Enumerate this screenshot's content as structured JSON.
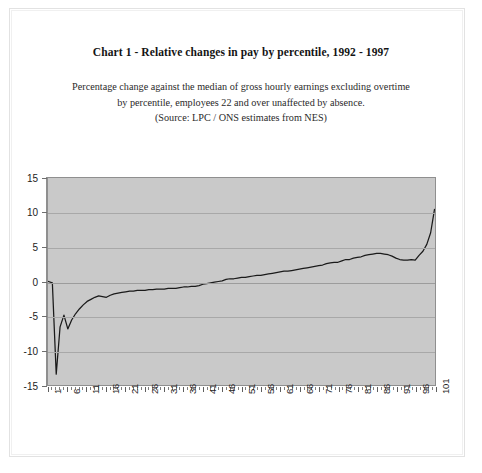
{
  "title": "Chart 1 -  Relative changes in pay by percentile, 1992 - 1997",
  "subtitle": {
    "line1": "Percentage change against the median of  gross hourly earnings excluding overtime",
    "line2": "by percentile, employees 22 and over  unaffected by absence.",
    "line3": "(Source: LPC / ONS estimates from NES)"
  },
  "chart_data": {
    "type": "line",
    "title": "Chart 1 -  Relative changes in pay by percentile, 1992 - 1997",
    "subtitle": "Percentage change against the median of  gross hourly earnings excluding overtime by percentile, employees 22 and over  unaffected by absence. (Source: LPC / ONS estimates from NES)",
    "xlabel": "",
    "ylabel": "",
    "xlim": [
      1,
      101
    ],
    "ylim": [
      -15,
      15
    ],
    "ytick_labels": [
      "15",
      "10",
      "5",
      "0",
      "-5",
      "-10",
      "-15"
    ],
    "ytick_values": [
      15,
      10,
      5,
      0,
      -5,
      -10,
      -15
    ],
    "xtick_labels": [
      "1",
      "6",
      "11",
      "16",
      "21",
      "26",
      "31",
      "36",
      "41",
      "46",
      "51",
      "56",
      "61",
      "66",
      "71",
      "76",
      "81",
      "86",
      "91",
      "96",
      "101"
    ],
    "xtick_values": [
      1,
      6,
      11,
      16,
      21,
      26,
      31,
      36,
      41,
      46,
      51,
      56,
      61,
      66,
      71,
      76,
      81,
      86,
      91,
      96,
      101
    ],
    "grid": true,
    "legend": "none",
    "plot_background": "#c9c9c9",
    "line_color": "#1a1a1a",
    "series": [
      {
        "name": "Relative change in pay by percentile 1992-1997",
        "x": [
          1,
          2,
          3,
          4,
          5,
          6,
          7,
          8,
          9,
          10,
          11,
          12,
          13,
          14,
          15,
          16,
          17,
          18,
          19,
          20,
          21,
          22,
          23,
          24,
          25,
          26,
          27,
          28,
          29,
          30,
          31,
          32,
          33,
          34,
          35,
          36,
          37,
          38,
          39,
          40,
          41,
          42,
          43,
          44,
          45,
          46,
          47,
          48,
          49,
          50,
          51,
          52,
          53,
          54,
          55,
          56,
          57,
          58,
          59,
          60,
          61,
          62,
          63,
          64,
          65,
          66,
          67,
          68,
          69,
          70,
          71,
          72,
          73,
          74,
          75,
          76,
          77,
          78,
          79,
          80,
          81,
          82,
          83,
          84,
          85,
          86,
          87,
          88,
          89,
          90,
          91,
          92,
          93,
          94,
          95,
          96,
          97,
          98,
          99,
          100,
          101
        ],
        "values": [
          0.0,
          -0.2,
          -13.5,
          -6.6,
          -4.9,
          -6.9,
          -5.6,
          -4.7,
          -4.0,
          -3.4,
          -2.9,
          -2.6,
          -2.3,
          -2.1,
          -2.2,
          -2.3,
          -2.0,
          -1.8,
          -1.7,
          -1.6,
          -1.5,
          -1.4,
          -1.4,
          -1.3,
          -1.3,
          -1.3,
          -1.2,
          -1.2,
          -1.1,
          -1.1,
          -1.1,
          -1.0,
          -1.0,
          -1.0,
          -0.9,
          -0.8,
          -0.8,
          -0.7,
          -0.7,
          -0.6,
          -0.4,
          -0.3,
          -0.2,
          -0.1,
          0.0,
          0.1,
          0.3,
          0.4,
          0.4,
          0.5,
          0.6,
          0.6,
          0.7,
          0.8,
          0.9,
          0.9,
          1.0,
          1.1,
          1.2,
          1.3,
          1.4,
          1.5,
          1.5,
          1.6,
          1.7,
          1.8,
          1.9,
          2.0,
          2.1,
          2.2,
          2.3,
          2.4,
          2.6,
          2.7,
          2.8,
          2.8,
          3.0,
          3.2,
          3.2,
          3.4,
          3.5,
          3.6,
          3.8,
          3.9,
          4.0,
          4.1,
          4.1,
          4.0,
          3.9,
          3.7,
          3.4,
          3.2,
          3.1,
          3.1,
          3.2,
          3.1,
          3.8,
          4.4,
          5.4,
          7.1,
          10.5
        ]
      }
    ]
  }
}
